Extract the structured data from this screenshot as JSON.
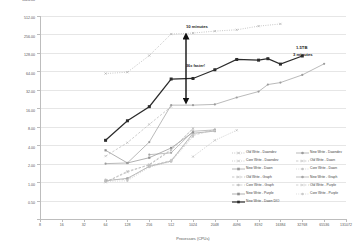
{
  "chart_data": {
    "type": "line",
    "title": "",
    "xlabel": "Processors (CPUs)",
    "ylabel": "Time (sec)",
    "xscale": "log2",
    "yscale": "log2",
    "xticks": [
      "8",
      "16",
      "32",
      "64",
      "128",
      "256",
      "512",
      "1024",
      "2048",
      "4096",
      "8192",
      "16384",
      "32768",
      "65536",
      "131072"
    ],
    "yticks": [
      "0.50",
      "1.00",
      "2.00",
      "4.00",
      "8.00",
      "16.00",
      "32.00",
      "64.00",
      "128.00",
      "256.00",
      "512.00",
      "1024.00"
    ],
    "xlim": [
      8,
      131072
    ],
    "ylim": [
      0.5,
      1024
    ],
    "grid": true,
    "legend_position": "inside-bottom-right",
    "series": [
      {
        "name": "Old Write - Dawndev",
        "color": "#a8a8a8",
        "style": "dotted",
        "marker": "cross",
        "points": [
          [
            64,
            118
          ],
          [
            128,
            124
          ],
          [
            256,
            232
          ],
          [
            512,
            520
          ],
          [
            1024,
            540
          ],
          [
            2048,
            580
          ],
          [
            4096,
            610
          ],
          [
            8192,
            700
          ],
          [
            16384,
            760
          ]
        ]
      },
      {
        "name": "Core Write - Dawndev",
        "color": "#b5b5b5",
        "style": "dotted",
        "marker": "cross",
        "points": [
          [
            1024,
            5.2
          ],
          [
            2048,
            9.6
          ],
          [
            4096,
            14.0
          ]
        ]
      },
      {
        "name": "New Write - Dawn",
        "color": "#9a9a9a",
        "style": "solid",
        "marker": "square",
        "points": [
          [
            64,
            2.1
          ],
          [
            128,
            2.3
          ],
          [
            256,
            3.6
          ],
          [
            512,
            4.4
          ],
          [
            1024,
            12.5
          ],
          [
            2048,
            13.6
          ]
        ]
      },
      {
        "name": "Old Write - Graph",
        "color": "#b0b0b0",
        "style": "dashed",
        "marker": "cross",
        "points": [
          [
            64,
            2.0
          ],
          [
            128,
            3.0
          ],
          [
            256,
            3.8
          ],
          [
            512,
            6.6
          ],
          [
            1024,
            15.0
          ]
        ]
      },
      {
        "name": "Core Write - Graph",
        "color": "#c0c0c0",
        "style": "dashed",
        "marker": "circle",
        "points": [
          [
            64,
            2.2
          ],
          [
            128,
            2.2
          ],
          [
            256,
            3.7
          ],
          [
            512,
            4.5
          ],
          [
            1024,
            11.5
          ],
          [
            2048,
            14.5
          ]
        ]
      },
      {
        "name": "New Write - Purple",
        "color": "#8f8f8f",
        "style": "solid",
        "marker": "square",
        "points": [
          [
            64,
            6.6
          ],
          [
            128,
            4.1
          ],
          [
            256,
            5.0
          ],
          [
            512,
            7.2
          ],
          [
            1024,
            13.0
          ]
        ]
      },
      {
        "name": "New Write - Dawn DIO",
        "color": "#2b2b2b",
        "style": "solid",
        "marker": "square",
        "points": [
          [
            64,
            9.6
          ],
          [
            128,
            20.0
          ],
          [
            256,
            34.0
          ],
          [
            512,
            96.0
          ],
          [
            1024,
            98.0
          ],
          [
            2048,
            136.0
          ],
          [
            4096,
            200.0
          ],
          [
            8192,
            195.0
          ],
          [
            11000,
            206.0
          ],
          [
            16384,
            168.0
          ],
          [
            32768,
            228.0
          ]
        ]
      },
      {
        "name": "New Write - Dawndev",
        "color": "#9c9c9c",
        "style": "solid",
        "marker": "circle",
        "points": [
          [
            64,
            4.0
          ],
          [
            128,
            4.1
          ],
          [
            256,
            9.0
          ],
          [
            512,
            36.0
          ],
          [
            1024,
            36.0
          ],
          [
            2048,
            37.0
          ],
          [
            4096,
            48.0
          ],
          [
            8192,
            60.0
          ],
          [
            11000,
            78.0
          ],
          [
            16384,
            84.0
          ],
          [
            32768,
            112.0
          ],
          [
            65536,
            170.0
          ]
        ]
      },
      {
        "name": "Old Write - Dawn",
        "color": "#b8b8b8",
        "style": "dashed",
        "marker": "cross",
        "points": [
          [
            64,
            5.3
          ],
          [
            128,
            8.8
          ],
          [
            256,
            17.5
          ],
          [
            512,
            34.0
          ]
        ]
      },
      {
        "name": "Core Write - Dawn",
        "color": "#c4c4c4",
        "style": "dotted",
        "marker": "circle",
        "points": [
          [
            64,
            2.05
          ],
          [
            128,
            2.1
          ],
          [
            256,
            3.5
          ],
          [
            512,
            4.3
          ],
          [
            1024,
            11.0
          ]
        ]
      },
      {
        "name": "New Write - Graph",
        "color": "#a5a5a5",
        "style": "solid",
        "marker": "circle",
        "points": [
          [
            256,
            5.6
          ],
          [
            512,
            6.0
          ],
          [
            1024,
            13.5
          ],
          [
            2048,
            14.2
          ]
        ]
      },
      {
        "name": "Old Write - Purple",
        "color": "#bdbdbd",
        "style": "dashed",
        "marker": "cross",
        "points": [
          [
            64,
            2.0
          ],
          [
            128,
            2.9
          ],
          [
            256,
            3.9
          ],
          [
            512,
            6.8
          ],
          [
            1024,
            14.8
          ]
        ]
      },
      {
        "name": "Core Write - Purple",
        "color": "#cacaca",
        "style": "dotted",
        "marker": "circle",
        "points": [
          [
            512,
            4.6
          ],
          [
            1024,
            12.0
          ],
          [
            2048,
            13.8
          ]
        ]
      }
    ],
    "annotations": [
      {
        "id": "ten-minutes",
        "text": "10 minutes"
      },
      {
        "id": "speedup",
        "text": "36x faster!"
      },
      {
        "id": "size",
        "text": "1.5TB"
      },
      {
        "id": "three-minutes",
        "text": "3 minutes"
      }
    ]
  },
  "axes": {
    "x_title": "Processors (CPUs)",
    "y_title": "Time (sec)"
  },
  "annotations": {
    "ten_minutes": "10 minutes",
    "speedup": "36x faster!",
    "size": "1.5TB",
    "three_minutes": "3 minutes"
  },
  "legend": {
    "column_a": [
      "Old Write - Dawndev",
      "Core Write - Dawndev",
      "New Write - Dawn",
      "Old Write - Graph",
      "Core Write - Graph",
      "New Write - Purple",
      "New Write - Dawn DIO"
    ],
    "column_b": [
      "New Write - Dawndev",
      "Old Write - Dawn",
      "Core Write - Dawn",
      "New Write - Graph",
      "Old Write - Purple",
      "Core Write - Purple"
    ]
  },
  "colors": {
    "highlight_series": "#2b2b2b",
    "grid": "#e6e6e6",
    "axis": "#bdbdbd",
    "text": "#555555"
  }
}
